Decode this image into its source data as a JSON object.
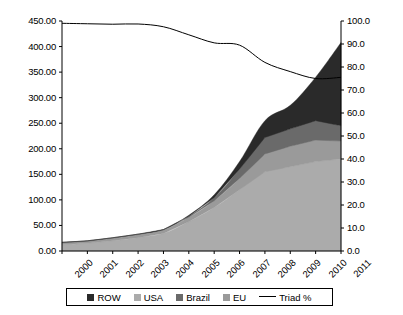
{
  "chart_data": {
    "type": "area",
    "title": "",
    "subtitle": "",
    "xlabel": "",
    "ylabel": "",
    "y2label": "",
    "grid": false,
    "stacked": true,
    "legend_position": "bottom",
    "categories": [
      "2000",
      "2001",
      "2002",
      "2003",
      "2004",
      "2005",
      "2006",
      "2007",
      "2008",
      "2009",
      "2010",
      "2011"
    ],
    "x_tick_labels": [
      "2000",
      "2001",
      "2002",
      "2003",
      "2004",
      "2005",
      "2006",
      "2007",
      "2008",
      "2009",
      "2010",
      "2011"
    ],
    "ylim": [
      0,
      450
    ],
    "y_tick_labels": [
      "0.00",
      "50.00",
      "100.00",
      "150.00",
      "200.00",
      "250.00",
      "300.00",
      "350.00",
      "400.00",
      "450.00"
    ],
    "y_ticks": [
      0,
      50,
      100,
      150,
      200,
      250,
      300,
      350,
      400,
      450
    ],
    "y2lim": [
      0,
      100
    ],
    "y2_tick_labels": [
      "0.0",
      "10.0",
      "20.0",
      "30.0",
      "40.0",
      "50.0",
      "60.0",
      "70.0",
      "80.0",
      "90.0",
      "100.0"
    ],
    "y2_ticks": [
      0,
      10,
      20,
      30,
      40,
      50,
      60,
      70,
      80,
      90,
      100
    ],
    "series": [
      {
        "name": "USA",
        "kind": "area",
        "color": "#ababab",
        "stack_order": 1,
        "values": [
          12,
          15,
          20,
          26,
          34,
          57,
          85,
          120,
          155,
          165,
          175,
          180
        ]
      },
      {
        "name": "EU",
        "kind": "area",
        "color": "#9a9a9a",
        "stack_order": 2,
        "values": [
          4,
          4,
          5,
          6,
          7,
          9,
          13,
          22,
          35,
          40,
          42,
          35
        ]
      },
      {
        "name": "Brazil",
        "kind": "area",
        "color": "#6a6a6a",
        "stack_order": 3,
        "values": [
          1,
          1,
          1,
          1,
          1,
          2,
          6,
          18,
          32,
          34,
          38,
          30
        ]
      },
      {
        "name": "ROW",
        "kind": "area",
        "color": "#2a2a2a",
        "stack_order": 4,
        "values": [
          0,
          0,
          0,
          0,
          0,
          2,
          6,
          15,
          33,
          46,
          85,
          163
        ]
      },
      {
        "name": "Triad %",
        "kind": "line",
        "color": "#000000",
        "axis": "right",
        "values": [
          99.0,
          98.8,
          98.6,
          98.7,
          97.5,
          94.0,
          90.5,
          89.5,
          82.0,
          78.0,
          75.0,
          75.5
        ]
      }
    ],
    "stack_totals": [
      17,
      20,
      26,
      33,
      42,
      70,
      110,
      175,
      255,
      285,
      340,
      408
    ]
  },
  "legend": {
    "items": [
      {
        "label": "ROW",
        "swatch": "#2a2a2a",
        "marker": "square"
      },
      {
        "label": "USA",
        "swatch": "#ababab",
        "marker": "square"
      },
      {
        "label": "Brazil",
        "swatch": "#6a6a6a",
        "marker": "square"
      },
      {
        "label": "EU",
        "swatch": "#9a9a9a",
        "marker": "square"
      },
      {
        "label": "Triad %",
        "swatch": "#000000",
        "marker": "line"
      }
    ]
  }
}
